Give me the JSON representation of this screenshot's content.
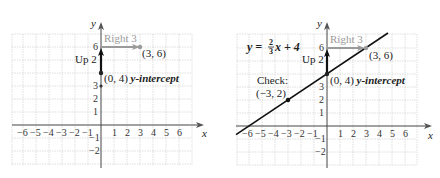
{
  "graphs": [
    {
      "id": "left",
      "origin": [
        101,
        125
      ],
      "unit": 13,
      "x_ticks": [
        "-6",
        "-5",
        "-4",
        "-3",
        "-2",
        "-1",
        "1",
        "2",
        "3",
        "4",
        "5",
        "6"
      ],
      "y_ticks_visible": [
        "6",
        "3",
        "2",
        "1",
        "-1",
        "-2"
      ],
      "x_axis_label": "x",
      "y_axis_label": "y",
      "labels": {
        "right": "Right 3",
        "up": "Up 2",
        "point_end": "(3, 6)",
        "intercept": "(0, 4) ",
        "intercept_term": "y-intercept"
      },
      "points": [
        {
          "x": 0,
          "y": 4
        },
        {
          "x": 3,
          "y": 6
        },
        {
          "x": 0,
          "y": 3
        }
      ]
    },
    {
      "id": "right",
      "origin": [
        327,
        126
      ],
      "unit": 13,
      "x_ticks": [
        "-6",
        "-5",
        "-4",
        "-3",
        "-2",
        "-1",
        "1",
        "2",
        "3",
        "4",
        "5",
        "6"
      ],
      "y_ticks_visible": [
        "6",
        "3",
        "2",
        "1",
        "-1",
        "-2"
      ],
      "x_axis_label": "x",
      "y_axis_label": "y",
      "equation": {
        "lhs": "y = ",
        "num": "2",
        "den": "3",
        "rhs": "x + 4"
      },
      "labels": {
        "right": "Right 3",
        "up": "Up 2",
        "point_end": "(3, 6)",
        "intercept": "(0, 4) ",
        "intercept_term": "y-intercept",
        "check": "Check:",
        "check_point": "(−3, 2)"
      },
      "points": [
        {
          "x": 0,
          "y": 4
        },
        {
          "x": 3,
          "y": 6
        },
        {
          "x": -3,
          "y": 2
        }
      ],
      "line": {
        "slope": 0.6667,
        "intercept": 4
      }
    }
  ],
  "colors": {
    "grid": "#d6d6d6",
    "axis": "#444444",
    "line": "#111111",
    "arrow_gray": "#9a9a9a",
    "text": "#222222"
  }
}
